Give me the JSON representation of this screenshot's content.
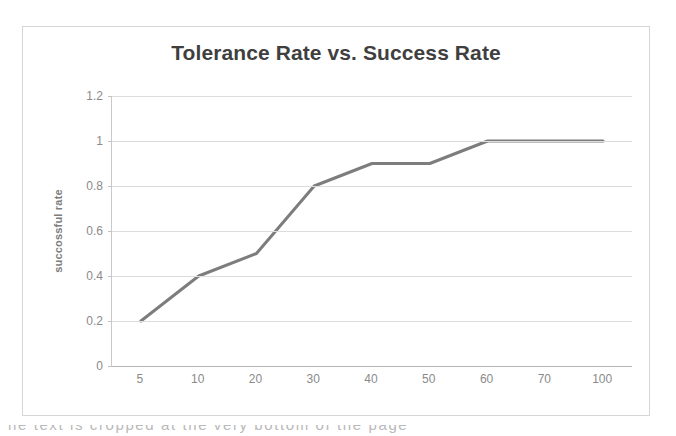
{
  "chart_data": {
    "type": "line",
    "title": "Tolerance Rate vs. Success Rate",
    "xlabel": "",
    "ylabel": "succossful rate",
    "categories": [
      "5",
      "10",
      "20",
      "30",
      "40",
      "50",
      "60",
      "70",
      "100"
    ],
    "values": [
      0.2,
      0.4,
      0.5,
      0.8,
      0.9,
      0.9,
      1,
      1,
      1
    ],
    "ylim": [
      0,
      1.2
    ],
    "yticks": [
      "0",
      "0.2",
      "0.4",
      "0.6",
      "0.8",
      "1",
      "1.2"
    ],
    "ytick_values": [
      0,
      0.2,
      0.4,
      0.6,
      0.8,
      1,
      1.2
    ],
    "grid": true,
    "legend": false,
    "legend_position": "none",
    "series_color": "#7d7d7d",
    "grid_color": "#dcdcdc",
    "title_color": "#3f3f3f",
    "tick_label_color": "#8a8a8a",
    "frame_color": "#d6d6d6"
  },
  "caption": {
    "cropped_text": "he text is cropped at the very bottom of the page"
  }
}
